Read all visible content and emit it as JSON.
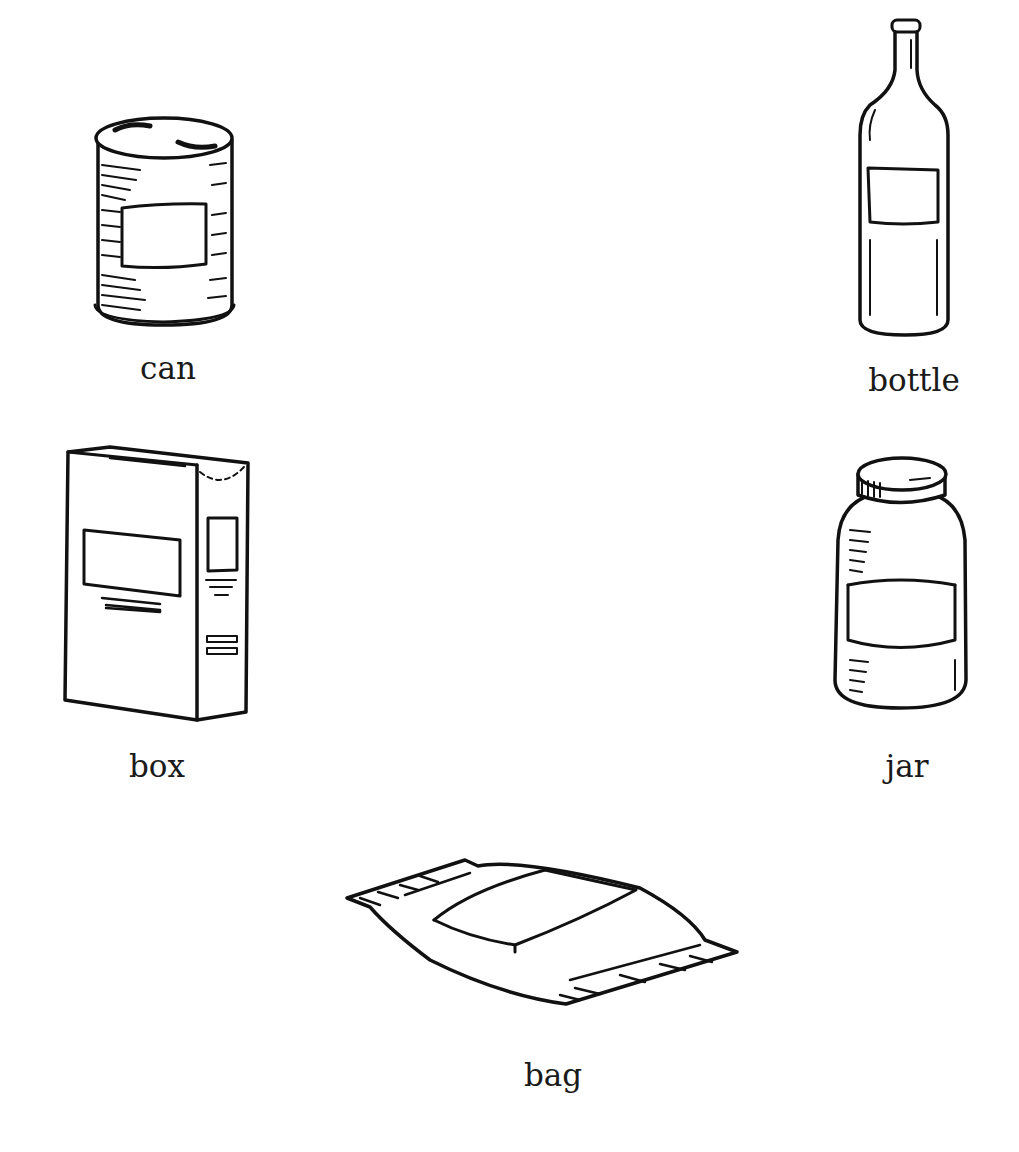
{
  "items": [
    {
      "id": "can",
      "label": "can"
    },
    {
      "id": "bottle",
      "label": "bottle"
    },
    {
      "id": "box",
      "label": "box"
    },
    {
      "id": "jar",
      "label": "jar"
    },
    {
      "id": "bag",
      "label": "bag"
    }
  ],
  "colors": {
    "background": "#ffffff",
    "ink": "#111111"
  }
}
